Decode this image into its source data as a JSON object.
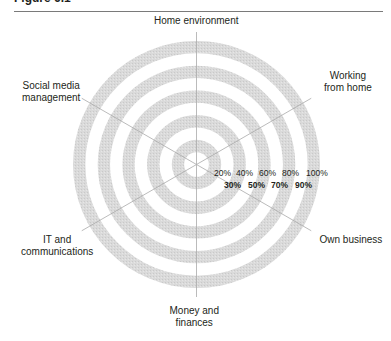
{
  "figure": {
    "title": "Figure 6.1"
  },
  "chart_data": {
    "type": "radar",
    "title": "",
    "axes": [
      "Home environment",
      "Working from home",
      "Own business",
      "Money and finances",
      "IT and communications",
      "Social media management"
    ],
    "axis_labels_display": [
      [
        "Home environment"
      ],
      [
        "Working",
        "from home"
      ],
      [
        "Own business"
      ],
      [
        "Money and",
        "finances"
      ],
      [
        "IT and",
        "communications"
      ],
      [
        "Social media",
        "management"
      ]
    ],
    "scale_range": [
      0,
      100
    ],
    "scale_unit": "%",
    "ring_step": 10,
    "scale_labels_row1": [
      "20%",
      "40%",
      "60%",
      "80%",
      "100%"
    ],
    "scale_labels_row2": [
      "30%",
      "50%",
      "70%",
      "90%"
    ],
    "series": [],
    "grid": true,
    "legend": "none",
    "colors": {
      "band_fill": "#d8d8d8",
      "band_empty": "#ffffff",
      "spoke": "#a9a9a9",
      "text": "#231f20"
    }
  }
}
